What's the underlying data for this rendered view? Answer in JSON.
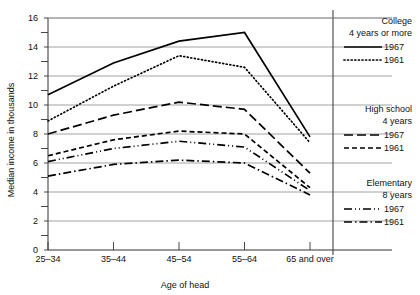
{
  "chart_data": {
    "type": "line",
    "title": "",
    "xlabel": "Age of head",
    "ylabel": "Median income in thousands",
    "categories": [
      "25–34",
      "35–44",
      "45–54",
      "55–64",
      "65 and over"
    ],
    "ylim": [
      0,
      16
    ],
    "ytick_labels": [
      "0",
      "2",
      "4",
      "6",
      "8",
      "10",
      "12",
      "14",
      "16"
    ],
    "ytick_values": [
      0,
      2,
      4,
      6,
      8,
      10,
      12,
      14,
      16
    ],
    "yminor_values": [
      1,
      3,
      5,
      7,
      9,
      11,
      13,
      15
    ],
    "grid": "horizontal-major",
    "legend_position": "right",
    "series": [
      {
        "name": "1967",
        "group": "College 4 years or more",
        "style": "solid",
        "dash": "none",
        "color": "#000000",
        "values": [
          10.7,
          12.9,
          14.4,
          15.0,
          7.8
        ]
      },
      {
        "name": "1961",
        "group": "College 4 years or more",
        "style": "dotted",
        "dash": "1,2.6",
        "color": "#000000",
        "values": [
          8.9,
          11.3,
          13.4,
          12.6,
          7.4
        ]
      },
      {
        "name": "1967",
        "group": "High school 4 years",
        "style": "dashed",
        "dash": "9,4",
        "color": "#000000",
        "values": [
          8.0,
          9.3,
          10.2,
          9.7,
          5.3
        ]
      },
      {
        "name": "1961",
        "group": "High school 4 years",
        "style": "short-dashed",
        "dash": "5,3",
        "color": "#000000",
        "values": [
          6.5,
          7.6,
          8.2,
          8.0,
          4.3
        ]
      },
      {
        "name": "1967",
        "group": "Elementary 8 years",
        "style": "dash-dot-dot",
        "dash": "8,3,1,3,1,3",
        "color": "#000000",
        "values": [
          6.1,
          7.0,
          7.5,
          7.1,
          4.1
        ]
      },
      {
        "name": "1961",
        "group": "Elementary 8 years",
        "style": "dash-dot",
        "dash": "8,3,1.5,3",
        "color": "#000000",
        "values": [
          5.1,
          5.9,
          6.2,
          6.0,
          3.8
        ]
      }
    ]
  },
  "legend": {
    "blocks": [
      {
        "title_line1": "College",
        "title_line2": "4 years or more",
        "entries": [
          {
            "label": "1967",
            "dash": "none"
          },
          {
            "label": "1961",
            "dash": "1,2.6"
          }
        ]
      },
      {
        "title_line1": "High school",
        "title_line2": "4 years",
        "entries": [
          {
            "label": "1967",
            "dash": "9,4"
          },
          {
            "label": "1961",
            "dash": "5,3"
          }
        ]
      },
      {
        "title_line1": "Elementary",
        "title_line2": "8 years",
        "entries": [
          {
            "label": "1967",
            "dash": "8,3,1,3,1,3"
          },
          {
            "label": "1961",
            "dash": "8,3,1.5,3"
          }
        ]
      }
    ]
  }
}
